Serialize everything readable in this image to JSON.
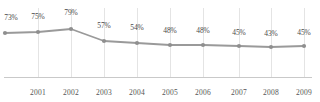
{
  "chart_data": {
    "type": "line",
    "title": "",
    "subtitle": "",
    "xlabel": "",
    "ylabel": "",
    "grid": true,
    "legend": "none",
    "ylim": [
      0,
      100
    ],
    "categories": [
      "",
      "2001",
      "2002",
      "2003",
      "2004",
      "2005",
      "2006",
      "2007",
      "2008",
      "2009"
    ],
    "tick_labels": [
      "2001",
      "2002",
      "2003",
      "2004",
      "2005",
      "2006",
      "2007",
      "2008",
      "2009"
    ],
    "values": [
      73,
      75,
      79,
      57,
      54,
      48,
      48,
      45,
      43,
      45
    ],
    "data_labels": [
      "73%",
      "75%",
      "79%",
      "57%",
      "54%",
      "48%",
      "48%",
      "45%",
      "43%",
      "45%"
    ],
    "series": [
      {
        "name": "",
        "values": [
          73,
          75,
          79,
          57,
          54,
          48,
          48,
          45,
          43,
          45
        ]
      }
    ]
  },
  "style": {
    "line_color": "#9a9a9a",
    "marker_color": "#8f8f8f",
    "grid_color": "#e4e4e4",
    "axis_color": "#c9c9c9",
    "label_color": "#4a4a4a",
    "tick_color": "#555555",
    "background": "#ffffff"
  },
  "points": [
    {
      "label": "73%",
      "x": 5,
      "y": 33,
      "label_x": 11,
      "label_y": 13,
      "grid": false,
      "tick": ""
    },
    {
      "label": "75%",
      "x": 38,
      "y": 32,
      "label_x": 38,
      "label_y": 12,
      "grid": true,
      "tick": "2001"
    },
    {
      "label": "79%",
      "x": 71,
      "y": 29,
      "label_x": 71,
      "label_y": 8,
      "grid": true,
      "tick": "2002"
    },
    {
      "label": "57%",
      "x": 104,
      "y": 41,
      "label_x": 104,
      "label_y": 21,
      "grid": true,
      "tick": "2003"
    },
    {
      "label": "54%",
      "x": 137,
      "y": 43,
      "label_x": 137,
      "label_y": 23,
      "grid": true,
      "tick": "2004"
    },
    {
      "label": "48%",
      "x": 170,
      "y": 45,
      "label_x": 170,
      "label_y": 26,
      "grid": true,
      "tick": "2005"
    },
    {
      "label": "48%",
      "x": 203,
      "y": 45,
      "label_x": 203,
      "label_y": 26,
      "grid": true,
      "tick": "2006"
    },
    {
      "label": "45%",
      "x": 239,
      "y": 46,
      "label_x": 239,
      "label_y": 28,
      "grid": true,
      "tick": "2007"
    },
    {
      "label": "43%",
      "x": 271,
      "y": 47,
      "label_x": 271,
      "label_y": 29,
      "grid": true,
      "tick": "2008"
    },
    {
      "label": "45%",
      "x": 304,
      "y": 46,
      "label_x": 304,
      "label_y": 28,
      "grid": true,
      "tick": "2009"
    }
  ]
}
